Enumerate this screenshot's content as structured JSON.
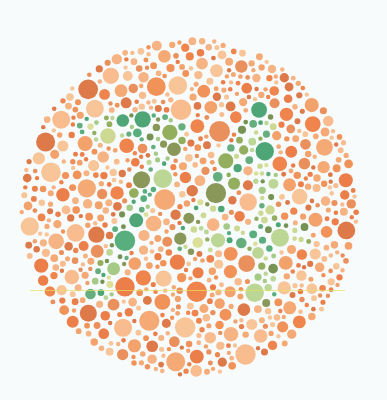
{
  "plate": {
    "type": "ishihara-color-test",
    "hidden_number": "74",
    "background_color": "#f7fbfc",
    "center": [
      189,
      207
    ],
    "radius": 170,
    "seed": 74,
    "dot_size_range": [
      2.2,
      10.5
    ],
    "background_palette": [
      "#f08a4b",
      "#f4a36a",
      "#ee7b3e",
      "#f7b685",
      "#e9733a",
      "#f39a5e",
      "#f5ad78",
      "#e8874f",
      "#f6c08f",
      "#db6e3a"
    ],
    "figure_palette": [
      "#3f9e6a",
      "#4aa872",
      "#7f8f4a",
      "#9dc57c",
      "#b6d38c",
      "#d9dc8e",
      "#8aa850",
      "#5aa774",
      "#c9d68a",
      "#6b8a45"
    ],
    "figure_strokes": {
      "digit_7": [
        [
          [
            88,
            130
          ],
          [
            178,
            124
          ]
        ],
        [
          [
            176,
            126
          ],
          [
            100,
            290
          ]
        ]
      ],
      "digit_4": [
        [
          [
            262,
            120
          ],
          [
            188,
            238
          ]
        ],
        [
          [
            184,
            240
          ],
          [
            300,
            236
          ]
        ],
        [
          [
            262,
            120
          ],
          [
            266,
            292
          ]
        ]
      ],
      "stroke_half_width": 13
    },
    "scan_line": {
      "y": 290,
      "x_start": 30,
      "x_end": 345,
      "color": "#e6e25a"
    }
  },
  "labels": {
    "description": "Color vision test plate with dotted figure"
  }
}
